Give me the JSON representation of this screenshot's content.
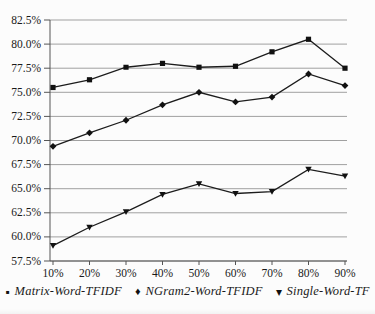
{
  "chart_data": {
    "type": "line",
    "title": "",
    "xlabel": "",
    "ylabel": "",
    "x_categories": [
      "10%",
      "20%",
      "30%",
      "40%",
      "50%",
      "60%",
      "70%",
      "80%",
      "90%"
    ],
    "y_tick_labels": [
      "57.5%",
      "60.0%",
      "62.5%",
      "65.0%",
      "67.5%",
      "70.0%",
      "72.5%",
      "75.0%",
      "77.5%",
      "80.0%",
      "82.5%"
    ],
    "y_tick_values": [
      57.5,
      60.0,
      62.5,
      65.0,
      67.5,
      70.0,
      72.5,
      75.0,
      77.5,
      80.0,
      82.5
    ],
    "ylim": [
      57.5,
      82.5
    ],
    "grid": true,
    "legend_position": "bottom",
    "series": [
      {
        "name": "Matrix-Word-TFIDF",
        "marker": "square",
        "values": [
          75.5,
          76.3,
          77.6,
          78.0,
          77.6,
          77.7,
          79.2,
          80.5,
          77.5
        ]
      },
      {
        "name": "NGram2-Word-TFIDF",
        "marker": "diamond",
        "values": [
          69.4,
          70.8,
          72.1,
          73.7,
          75.0,
          74.0,
          74.5,
          76.9,
          75.7
        ]
      },
      {
        "name": "Single-Word-TF",
        "marker": "triangle-down",
        "values": [
          59.1,
          61.0,
          62.6,
          64.4,
          65.5,
          64.5,
          64.7,
          67.0,
          66.3
        ]
      }
    ],
    "colors": {
      "line": "#1c1c1c",
      "marker": "#111111",
      "grid": "#a0a0a0",
      "axis": "#555555",
      "text": "#1a1a1a",
      "background": "#fcfcfc"
    }
  },
  "legend": {
    "items": [
      {
        "glyph": "▪",
        "marker": "square",
        "label": "Matrix-Word-TFIDF"
      },
      {
        "glyph": "♦",
        "marker": "diamond",
        "label": "NGram2-Word-TFIDF"
      },
      {
        "glyph": "▾",
        "marker": "triangle-down",
        "label": "Single-Word-TF"
      }
    ]
  }
}
